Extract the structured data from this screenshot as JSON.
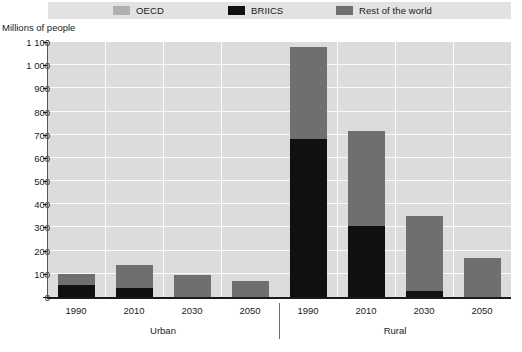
{
  "axis_title": "Millions of people",
  "legend": {
    "items": [
      {
        "label": "OECD",
        "color": "#b0b0b0",
        "name": "legend-oecd"
      },
      {
        "label": "BRIICS",
        "color": "#101010",
        "name": "legend-briics"
      },
      {
        "label": "Rest of the world",
        "color": "#6f6f6f",
        "name": "legend-rest-of-world"
      }
    ]
  },
  "colors": {
    "oecd": "#b0b0b0",
    "briics": "#101010",
    "rest_of_world": "#6f6f6f",
    "plot_background": "#dcdcdc",
    "gridline": "#fafafa",
    "axis": "#1a1a1a",
    "legend_background": "#e2e2e2"
  },
  "chart_data": {
    "type": "bar",
    "title": "",
    "subtitle": "",
    "xlabel": "",
    "ylabel": "Millions of people",
    "ylim": [
      0,
      1100
    ],
    "ytick_values": [
      0,
      100,
      200,
      300,
      400,
      500,
      600,
      700,
      800,
      900,
      1000,
      1100
    ],
    "ytick_labels": [
      "0",
      "100",
      "200",
      "300",
      "400",
      "500",
      "600",
      "700",
      "800",
      "900",
      "1 000",
      "1 100"
    ],
    "grid": true,
    "stacked": true,
    "legend_position": "top",
    "groups": [
      "Urban",
      "Rural"
    ],
    "categories": [
      "1990",
      "2010",
      "2030",
      "2050",
      "1990",
      "2010",
      "2030",
      "2050"
    ],
    "series": [
      {
        "name": "BRIICS",
        "color": "#101010",
        "values": [
          50,
          40,
          0,
          0,
          680,
          305,
          25,
          0
        ]
      },
      {
        "name": "OECD",
        "color": "#b0b0b0",
        "values": [
          0,
          0,
          0,
          0,
          0,
          0,
          0,
          0
        ]
      },
      {
        "name": "Rest of the world",
        "color": "#6f6f6f",
        "values": [
          50,
          100,
          95,
          70,
          400,
          410,
          325,
          170
        ]
      }
    ],
    "totals": [
      100,
      140,
      95,
      70,
      1080,
      715,
      350,
      170
    ],
    "bars": [
      {
        "group": "Urban",
        "category": "1990",
        "briics": 50,
        "rest_of_world": 50,
        "oecd": 0,
        "total": 100
      },
      {
        "group": "Urban",
        "category": "2010",
        "briics": 40,
        "rest_of_world": 100,
        "oecd": 0,
        "total": 140
      },
      {
        "group": "Urban",
        "category": "2030",
        "briics": 0,
        "rest_of_world": 95,
        "oecd": 0,
        "total": 95
      },
      {
        "group": "Urban",
        "category": "2050",
        "briics": 0,
        "rest_of_world": 70,
        "oecd": 0,
        "total": 70
      },
      {
        "group": "Rural",
        "category": "1990",
        "briics": 680,
        "rest_of_world": 400,
        "oecd": 0,
        "total": 1080
      },
      {
        "group": "Rural",
        "category": "2010",
        "briics": 305,
        "rest_of_world": 410,
        "oecd": 0,
        "total": 715
      },
      {
        "group": "Rural",
        "category": "2030",
        "briics": 25,
        "rest_of_world": 325,
        "oecd": 0,
        "total": 350
      },
      {
        "group": "Rural",
        "category": "2050",
        "briics": 0,
        "rest_of_world": 170,
        "oecd": 0,
        "total": 170
      }
    ]
  }
}
